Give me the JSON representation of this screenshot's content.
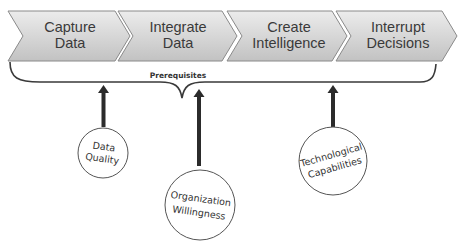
{
  "diagram": {
    "process_steps": [
      {
        "line1": "Capture",
        "line2": "Data"
      },
      {
        "line1": "Integrate",
        "line2": "Data"
      },
      {
        "line1": "Create",
        "line2": "Intelligence"
      },
      {
        "line1": "Interrupt",
        "line2": "Decisions"
      }
    ],
    "brace_label": "Prerequisites",
    "prerequisites": [
      {
        "line1": "Data",
        "line2": "Quality"
      },
      {
        "line1": "Organization",
        "line2": "Willingness"
      },
      {
        "line1": "Technological",
        "line2": "Capabilities"
      }
    ],
    "colors": {
      "chevron_fill_top": "#ececec",
      "chevron_fill_bottom": "#c4c4c4",
      "chevron_stroke": "#8a8a8a",
      "arrow": "#2b2b2b",
      "brace": "#3a3a3a",
      "circle_stroke": "#555555"
    }
  }
}
